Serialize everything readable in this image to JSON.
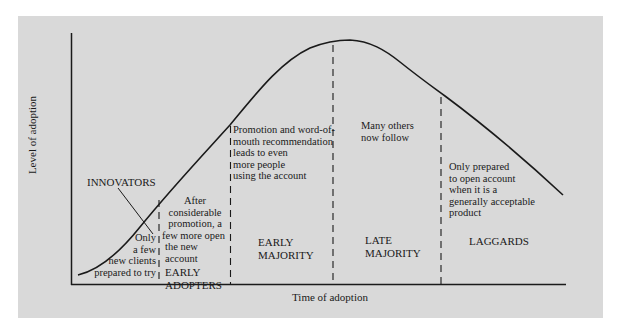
{
  "diagram": {
    "type": "adoption_curve",
    "axes": {
      "y_label": "Level of adoption",
      "x_label": "Time of adoption"
    },
    "segments": [
      {
        "id": "innovators",
        "category": "INNOVATORS",
        "description": [
          "Only",
          "a few",
          "new clients",
          "prepared to try"
        ]
      },
      {
        "id": "early_adopters",
        "category_lines": [
          "EARLY",
          "ADOPTERS"
        ],
        "description": [
          "After",
          "considerable",
          "promotion, a",
          "few more open",
          "the new",
          "account"
        ]
      },
      {
        "id": "early_majority",
        "category_lines": [
          "EARLY",
          "MAJORITY"
        ],
        "description": [
          "Promotion and word-of-",
          "mouth recommendation",
          "leads to even",
          "more people",
          "using the account"
        ]
      },
      {
        "id": "late_majority",
        "category_lines": [
          "LATE",
          "MAJORITY"
        ],
        "description": [
          "Many others",
          "now follow"
        ]
      },
      {
        "id": "laggards",
        "category_lines": [
          "LAGGARDS"
        ],
        "description": [
          "Only prepared",
          "to open account",
          "when it is a",
          "generally acceptable",
          "product"
        ]
      }
    ],
    "colors": {
      "panel_background": "#d9d9d9",
      "line": "#1a1a1a"
    }
  }
}
